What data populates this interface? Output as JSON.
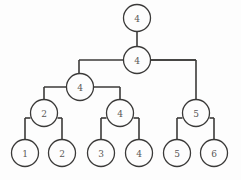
{
  "diagram": {
    "type": "tree",
    "title": "",
    "background_color": "#fdfdfd",
    "stroke_color": "#3b3a39",
    "label_color": "#5a5856",
    "node_radius": 13.5,
    "nodes": [
      {
        "id": "root",
        "label": "4",
        "x": 137,
        "y": 18,
        "level": 0,
        "name": "node-root-4"
      },
      {
        "id": "n1",
        "label": "4",
        "x": 137,
        "y": 60,
        "level": 1,
        "name": "node-level1-4"
      },
      {
        "id": "n2",
        "label": "4",
        "x": 80,
        "y": 87,
        "level": 2,
        "name": "node-level2-left-4"
      },
      {
        "id": "n3",
        "label": "2",
        "x": 44,
        "y": 113,
        "level": 3,
        "name": "node-level3-2"
      },
      {
        "id": "n4",
        "label": "4",
        "x": 120,
        "y": 113,
        "level": 3,
        "name": "node-level3-4"
      },
      {
        "id": "n5",
        "label": "5",
        "x": 196,
        "y": 113,
        "level": 3,
        "name": "node-level3-5"
      },
      {
        "id": "l1",
        "label": "1",
        "x": 25,
        "y": 153,
        "level": 4,
        "name": "leaf-node-1"
      },
      {
        "id": "l2",
        "label": "2",
        "x": 62,
        "y": 153,
        "level": 4,
        "name": "leaf-node-2"
      },
      {
        "id": "l3",
        "label": "3",
        "x": 101,
        "y": 153,
        "level": 4,
        "name": "leaf-node-3"
      },
      {
        "id": "l4",
        "label": "4",
        "x": 139,
        "y": 153,
        "level": 4,
        "name": "leaf-node-4"
      },
      {
        "id": "l5",
        "label": "5",
        "x": 177,
        "y": 153,
        "level": 4,
        "name": "leaf-node-5"
      },
      {
        "id": "l6",
        "label": "6",
        "x": 214,
        "y": 153,
        "level": 4,
        "name": "leaf-node-6"
      }
    ],
    "edges": [
      {
        "from": "root",
        "to": "n1",
        "name": "edge-root-to-level1"
      },
      {
        "from": "n1",
        "to": "n2",
        "name": "edge-level1-to-level2left"
      },
      {
        "from": "n1",
        "to": "n5",
        "name": "edge-level1-to-node5"
      },
      {
        "from": "n2",
        "to": "n3",
        "name": "edge-level2-to-node2"
      },
      {
        "from": "n2",
        "to": "n4",
        "name": "edge-level2-to-node4"
      },
      {
        "from": "n3",
        "to": "l1",
        "name": "edge-node2-to-leaf1"
      },
      {
        "from": "n3",
        "to": "l2",
        "name": "edge-node2-to-leaf2"
      },
      {
        "from": "n4",
        "to": "l3",
        "name": "edge-node4-to-leaf3"
      },
      {
        "from": "n4",
        "to": "l4",
        "name": "edge-node4-to-leaf4"
      },
      {
        "from": "n5",
        "to": "l5",
        "name": "edge-node5-to-leaf5"
      },
      {
        "from": "n5",
        "to": "l6",
        "name": "edge-node5-to-leaf6"
      }
    ],
    "paths": [
      {
        "d": "M 137 31.5 L 137 46.5",
        "name": "edge-root-to-level1"
      },
      {
        "d": "M 137 60 L 123.5 60",
        "name": "edge-level1-left-stub"
      },
      {
        "d": "M 79 60 L 196 60",
        "name": "edge-level1-horizontal-bar"
      },
      {
        "d": "M 79 60 L 79 78",
        "name": "edge-down-to-level2left"
      },
      {
        "d": "M 79 78 L 80 78",
        "name": "edge-join-level2left"
      },
      {
        "d": "M 196 60 L 196 99.5",
        "name": "edge-down-to-node5"
      },
      {
        "d": "M 150.5 60 L 196 60",
        "name": "edge-level1-right-stub"
      },
      {
        "d": "M 44 87 L 120 87",
        "name": "edge-level2-horizontal-bar"
      },
      {
        "d": "M 44 87 L 44 99.5",
        "name": "edge-down-to-node2"
      },
      {
        "d": "M 120 87 L 120 99.5",
        "name": "edge-down-to-node4"
      },
      {
        "d": "M 25 118 L 25 139.5",
        "name": "edge-leaf1-vertical"
      },
      {
        "d": "M 62 118 L 62 139.5",
        "name": "edge-leaf2-vertical"
      },
      {
        "d": "M 25 118 L 30.5 118",
        "name": "edge-node2-left-bar"
      },
      {
        "d": "M 57.5 118 L 62 118",
        "name": "edge-node2-right-bar"
      },
      {
        "d": "M 101 118 L 101 139.5",
        "name": "edge-leaf3-vertical"
      },
      {
        "d": "M 139 118 L 139 139.5",
        "name": "edge-leaf4-vertical"
      },
      {
        "d": "M 101 118 L 106.5 118",
        "name": "edge-node4-left-bar"
      },
      {
        "d": "M 133.5 118 L 139 118",
        "name": "edge-node4-right-bar"
      },
      {
        "d": "M 177 118 L 177 139.5",
        "name": "edge-leaf5-vertical"
      },
      {
        "d": "M 214 118 L 214 139.5",
        "name": "edge-leaf6-vertical"
      },
      {
        "d": "M 177 118 L 182.5 118",
        "name": "edge-node5-left-bar"
      },
      {
        "d": "M 209.5 118 L 214 118",
        "name": "edge-node5-right-bar"
      }
    ]
  }
}
